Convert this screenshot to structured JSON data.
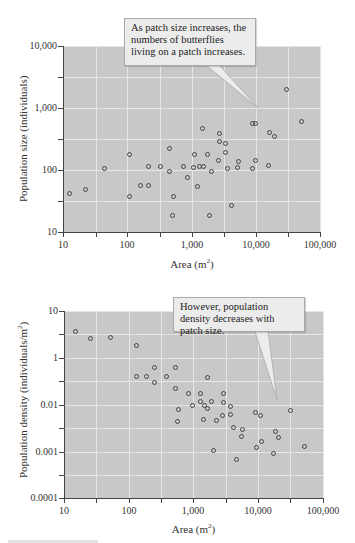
{
  "chart_data": [
    {
      "type": "scatter",
      "title": "",
      "xlabel": "Area (m²)",
      "ylabel": "Population size (individuals)",
      "xscale": "log",
      "yscale": "log",
      "xlim": [
        10,
        100000
      ],
      "ylim": [
        10,
        10000
      ],
      "grid": true,
      "x_tick_labels": [
        "10",
        "100",
        "1,000",
        "10,000",
        "100,000"
      ],
      "y_tick_labels": [
        "10,000",
        "1,000",
        "100",
        "10"
      ],
      "annotation": "As patch size increases, the numbers of butterflies living on a patch increases.",
      "points": [
        [
          12,
          43
        ],
        [
          21,
          49
        ],
        [
          42,
          108
        ],
        [
          100,
          180
        ],
        [
          100,
          37
        ],
        [
          200,
          115
        ],
        [
          150,
          57
        ],
        [
          200,
          57
        ],
        [
          310,
          115
        ],
        [
          430,
          225
        ],
        [
          430,
          97
        ],
        [
          490,
          37
        ],
        [
          470,
          18
        ],
        [
          700,
          115
        ],
        [
          800,
          77
        ],
        [
          1000,
          180
        ],
        [
          1000,
          112
        ],
        [
          1150,
          55
        ],
        [
          1200,
          115
        ],
        [
          1300,
          470
        ],
        [
          1400,
          118
        ],
        [
          1600,
          180
        ],
        [
          1700,
          18
        ],
        [
          1900,
          97
        ],
        [
          2400,
          145
        ],
        [
          2500,
          400
        ],
        [
          2500,
          290
        ],
        [
          3100,
          200
        ],
        [
          3100,
          270
        ],
        [
          3400,
          110
        ],
        [
          4000,
          28
        ],
        [
          4800,
          112
        ],
        [
          5000,
          137
        ],
        [
          8000,
          590
        ],
        [
          9100,
          590
        ],
        [
          8000,
          108
        ],
        [
          9100,
          145
        ],
        [
          14000,
          122
        ],
        [
          15000,
          400
        ],
        [
          18000,
          350
        ],
        [
          28000,
          2000
        ],
        [
          47000,
          610
        ]
      ]
    },
    {
      "type": "scatter",
      "title": "",
      "xlabel": "Area (m²)",
      "ylabel": "Population density (individuals/m²)",
      "xscale": "log",
      "yscale": "log",
      "xlim": [
        10,
        100000
      ],
      "ylim": [
        0.0001,
        10
      ],
      "grid": true,
      "x_tick_labels": [
        "10",
        "100",
        "1,000",
        "10,000",
        "100,000"
      ],
      "y_tick_labels": [
        "10",
        "1",
        "0.01",
        "0.001",
        "0.0001"
      ],
      "annotation": "However, population density decreases with patch size.",
      "points": [
        [
          14,
          3.7
        ],
        [
          24,
          2.6
        ],
        [
          50,
          2.7
        ],
        [
          125,
          1.8
        ],
        [
          125,
          0.38
        ],
        [
          180,
          0.38
        ],
        [
          240,
          0.6
        ],
        [
          240,
          0.28
        ],
        [
          360,
          0.38
        ],
        [
          490,
          0.6
        ],
        [
          490,
          0.22
        ],
        [
          540,
          0.08
        ],
        [
          530,
          0.042
        ],
        [
          780,
          0.17
        ],
        [
          900,
          0.09
        ],
        [
          1200,
          0.17
        ],
        [
          1200,
          0.11
        ],
        [
          1300,
          0.1
        ],
        [
          1300,
          0.048
        ],
        [
          1500,
          0.37
        ],
        [
          1500,
          0.085
        ],
        [
          1800,
          0.11
        ],
        [
          2000,
          0.0011
        ],
        [
          2100,
          0.045
        ],
        [
          2600,
          0.06
        ],
        [
          2800,
          0.17
        ],
        [
          2800,
          0.11
        ],
        [
          3500,
          0.088
        ],
        [
          3500,
          0.062
        ],
        [
          3900,
          0.033
        ],
        [
          4400,
          0.0007
        ],
        [
          5400,
          0.022
        ],
        [
          5700,
          0.029
        ],
        [
          9100,
          0.068
        ],
        [
          9300,
          0.0013
        ],
        [
          10500,
          0.06
        ],
        [
          10800,
          0.0017
        ],
        [
          16000,
          0.0009
        ],
        [
          17000,
          0.0026
        ],
        [
          19000,
          0.002
        ],
        [
          29000,
          0.0072
        ],
        [
          50000,
          0.0013
        ]
      ]
    }
  ],
  "charts": [
    {
      "plot": {
        "left": 63,
        "top": 46,
        "width": 258,
        "height": 186
      },
      "x_ticks_px": [
        63,
        96,
        127,
        160,
        192,
        224,
        256,
        288,
        320
      ],
      "y_ticks_px": [
        46,
        77,
        108,
        139,
        170,
        201,
        232
      ],
      "x_labels": [
        {
          "text": "10",
          "px": 63
        },
        {
          "text": "100",
          "px": 127
        },
        {
          "text": "1,000",
          "px": 192
        },
        {
          "text": "10,000",
          "px": 256
        },
        {
          "text": "100,000",
          "px": 320
        }
      ],
      "y_labels": [
        {
          "text": "10,000",
          "px": 46
        },
        {
          "text": "1,000",
          "px": 108
        },
        {
          "text": "100",
          "px": 170
        },
        {
          "text": "10",
          "px": 232
        }
      ],
      "xlabel": "Area (m",
      "ylabel": "Population size (individuals)",
      "points_px": [
        [
          69,
          193
        ],
        [
          85,
          189
        ],
        [
          104,
          168
        ],
        [
          129,
          154
        ],
        [
          129,
          196
        ],
        [
          148,
          166
        ],
        [
          140,
          185
        ],
        [
          148,
          185
        ],
        [
          160,
          166
        ],
        [
          169,
          148
        ],
        [
          169,
          171
        ],
        [
          173,
          196
        ],
        [
          172,
          215
        ],
        [
          183,
          166
        ],
        [
          187,
          177
        ],
        [
          194,
          154
        ],
        [
          193,
          167
        ],
        [
          197,
          186
        ],
        [
          199,
          166
        ],
        [
          202,
          128
        ],
        [
          203,
          166
        ],
        [
          207,
          154
        ],
        [
          209,
          215
        ],
        [
          211,
          171
        ],
        [
          218,
          160
        ],
        [
          219,
          133
        ],
        [
          219,
          141
        ],
        [
          225,
          152
        ],
        [
          225,
          143
        ],
        [
          227,
          168
        ],
        [
          231,
          205
        ],
        [
          237,
          167
        ],
        [
          238,
          161
        ],
        [
          252,
          123
        ],
        [
          255,
          123
        ],
        [
          252,
          168
        ],
        [
          255,
          160
        ],
        [
          268,
          165
        ],
        [
          269,
          132
        ],
        [
          274,
          136
        ],
        [
          286,
          89
        ],
        [
          301,
          121
        ]
      ],
      "callout": {
        "left": 124,
        "top": 18,
        "width": 132,
        "height": 48,
        "tip": [
          258,
          108
        ],
        "base": [
          214,
          253
        ]
      },
      "xtitle_top": 257,
      "ytitle_left": 17,
      "ytitle_top": 202
    },
    {
      "plot": {
        "left": 64,
        "top": 311,
        "width": 259,
        "height": 187
      },
      "x_ticks_px": [
        64,
        96,
        129,
        161,
        193,
        226,
        258,
        290,
        323
      ],
      "y_ticks_px": [
        311,
        334,
        358,
        381,
        405,
        428,
        452,
        475,
        498
      ],
      "x_labels": [
        {
          "text": "10",
          "px": 64
        },
        {
          "text": "100",
          "px": 129
        },
        {
          "text": "1,000",
          "px": 193
        },
        {
          "text": "10,000",
          "px": 258
        },
        {
          "text": "100,000",
          "px": 323
        }
      ],
      "y_labels": [
        {
          "text": "10",
          "px": 311
        },
        {
          "text": "1",
          "px": 358
        },
        {
          "text": "0.01",
          "px": 405
        },
        {
          "text": "0.001",
          "px": 452
        },
        {
          "text": "0.0001",
          "px": 498
        }
      ],
      "xlabel": "Area (m",
      "ylabel": "Population density (individuals/m",
      "points_px": [
        [
          75,
          331
        ],
        [
          90,
          338
        ],
        [
          110,
          337
        ],
        [
          136,
          345
        ],
        [
          136,
          376
        ],
        [
          146,
          376
        ],
        [
          154,
          367
        ],
        [
          154,
          382
        ],
        [
          166,
          376
        ],
        [
          175,
          367
        ],
        [
          175,
          388
        ],
        [
          178,
          409
        ],
        [
          177,
          421
        ],
        [
          188,
          393
        ],
        [
          192,
          405
        ],
        [
          200,
          393
        ],
        [
          200,
          401
        ],
        [
          204,
          405
        ],
        [
          203,
          419
        ],
        [
          207,
          377
        ],
        [
          207,
          408
        ],
        [
          211,
          401
        ],
        [
          213,
          450
        ],
        [
          216,
          420
        ],
        [
          222,
          415
        ],
        [
          223,
          393
        ],
        [
          223,
          402
        ],
        [
          230,
          406
        ],
        [
          230,
          414
        ],
        [
          233,
          427
        ],
        [
          236,
          459
        ],
        [
          241,
          436
        ],
        [
          242,
          429
        ],
        [
          255,
          412
        ],
        [
          256,
          447
        ],
        [
          260,
          415
        ],
        [
          261,
          441
        ],
        [
          273,
          453
        ],
        [
          275,
          431
        ],
        [
          278,
          437
        ],
        [
          290,
          410
        ],
        [
          304,
          446
        ]
      ],
      "callout": {
        "left": 173,
        "top": 297,
        "width": 132,
        "height": 35,
        "tip": [
          277,
          400
        ],
        "base": [
          245,
          260
        ]
      },
      "xtitle_top": 522,
      "ytitle_left": 16,
      "ytitle_top": 478
    }
  ],
  "caption_visible": "cropped"
}
